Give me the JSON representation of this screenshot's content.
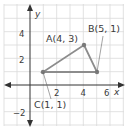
{
  "diagram": {
    "type": "coordinate-plane-triangle",
    "axes": {
      "x_label": "x",
      "y_label": "y",
      "x_ticks": [
        "2",
        "4",
        "6"
      ],
      "y_ticks": [
        "4",
        "2",
        "−2"
      ]
    },
    "points": [
      {
        "name": "A",
        "label": "A(4, 3)",
        "x": 4,
        "y": 3
      },
      {
        "name": "B",
        "label": "B(5, 1)",
        "x": 5,
        "y": 1
      },
      {
        "name": "C",
        "label": "C(1, 1)",
        "x": 1,
        "y": 1
      }
    ],
    "colors": {
      "grid": "#d9d9d9",
      "axis": "#333333",
      "triangle": "#8c8c8c",
      "text": "#3a3a3a"
    }
  }
}
